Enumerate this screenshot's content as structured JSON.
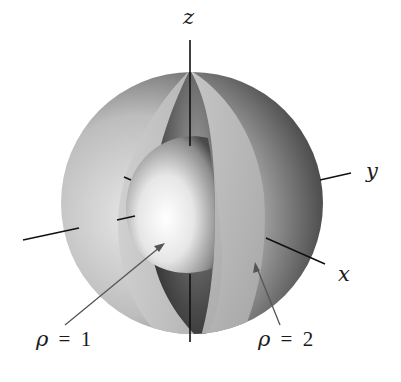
{
  "figure": {
    "axes": {
      "z_label": "z",
      "y_label": "y",
      "x_label": "x"
    },
    "annotations": {
      "inner_sphere": {
        "rho_symbol": "ρ",
        "equals": "=",
        "value": "1"
      },
      "outer_sphere": {
        "rho_symbol": "ρ",
        "equals": "=",
        "value": "2"
      }
    },
    "colors": {
      "background": "#ffffff",
      "outer_shell_dark": "#2a2a2a",
      "outer_shell_light": "#e0e0e0",
      "inner_sphere_highlight": "#fafafa",
      "inner_sphere_shadow": "#6a6a6a",
      "axis": "#111111",
      "arrow": "#555555"
    }
  }
}
